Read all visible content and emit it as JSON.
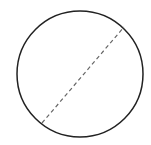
{
  "diagram": {
    "type": "circle-with-diameter",
    "background": "#ffffff",
    "circle": {
      "cx": 80,
      "cy": 74,
      "r": 63,
      "stroke": "#222222",
      "stroke_width": 1.5
    },
    "diameter": {
      "x1": 42,
      "y1": 123,
      "x2": 124,
      "y2": 27,
      "stroke": "#666666",
      "stroke_width": 1.2,
      "dasharray": "4 3",
      "style": "dashed"
    }
  }
}
